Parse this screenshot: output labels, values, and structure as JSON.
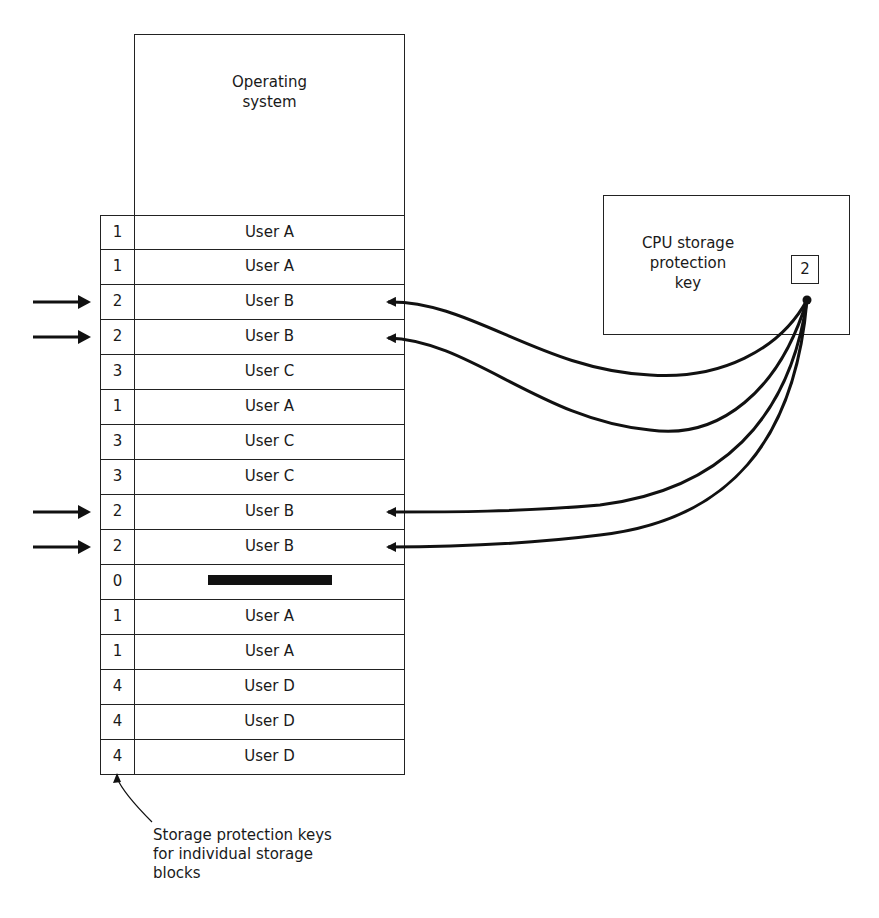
{
  "diagram": {
    "memory": {
      "os_label": "Operating system",
      "rows": [
        {
          "key": "1",
          "owner": "User A",
          "marked": false
        },
        {
          "key": "1",
          "owner": "User A",
          "marked": false
        },
        {
          "key": "2",
          "owner": "User B",
          "marked": true
        },
        {
          "key": "2",
          "owner": "User B",
          "marked": true
        },
        {
          "key": "3",
          "owner": "User C",
          "marked": false
        },
        {
          "key": "1",
          "owner": "User A",
          "marked": false
        },
        {
          "key": "3",
          "owner": "User C",
          "marked": false
        },
        {
          "key": "3",
          "owner": "User C",
          "marked": false
        },
        {
          "key": "2",
          "owner": "User B",
          "marked": true
        },
        {
          "key": "2",
          "owner": "User B",
          "marked": true
        },
        {
          "key": "0",
          "owner": "",
          "marked": false,
          "blocked": true
        },
        {
          "key": "1",
          "owner": "User A",
          "marked": false
        },
        {
          "key": "1",
          "owner": "User A",
          "marked": false
        },
        {
          "key": "4",
          "owner": "User D",
          "marked": false
        },
        {
          "key": "4",
          "owner": "User D",
          "marked": false
        },
        {
          "key": "4",
          "owner": "User D",
          "marked": false
        }
      ]
    },
    "cpu": {
      "label_line1": "CPU storage",
      "label_line2": "protection",
      "label_line3": "key",
      "key_value": "2"
    },
    "caption": {
      "line1": "Storage protection keys",
      "line2": "for individual storage",
      "line3": "blocks"
    },
    "colors": {
      "line": "#111111",
      "background": "#ffffff"
    }
  }
}
